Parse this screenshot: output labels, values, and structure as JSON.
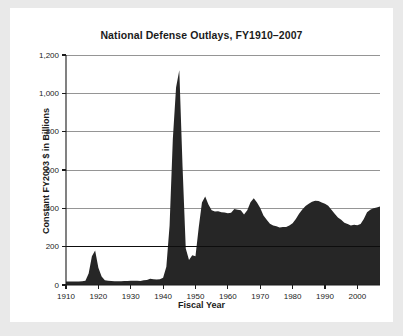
{
  "figure": {
    "background": "#e9e9e9",
    "card_background": "#ffffff",
    "title": "National Defense Outlays, FY1910–2007"
  },
  "chart_data": {
    "type": "area",
    "title": "National Defense Outlays, FY1910–2007",
    "xlabel": "Fiscal Year",
    "ylabel": "Constant FY2003 $ in Billions",
    "xlim": [
      1910,
      2007
    ],
    "ylim": [
      0,
      1200
    ],
    "grid": true,
    "legend": null,
    "fill_color": "#262626",
    "gridline_color": "#8a8a8a",
    "axis_color": "#1b1b1b",
    "emphasized_gridline": 200,
    "ytick_labels": [
      "0",
      "200",
      "400",
      "600",
      "800",
      "1,000",
      "1,200"
    ],
    "yticks": [
      0,
      200,
      400,
      600,
      800,
      1000,
      1200
    ],
    "xtick_labels": [
      "1910",
      "1920",
      "1930",
      "1940",
      "1950",
      "1960",
      "1970",
      "1980",
      "1990",
      "2000"
    ],
    "xticks": [
      1910,
      1920,
      1930,
      1940,
      1950,
      1960,
      1970,
      1980,
      1990,
      2000
    ],
    "x": [
      1910,
      1911,
      1912,
      1913,
      1914,
      1915,
      1916,
      1917,
      1918,
      1919,
      1920,
      1921,
      1922,
      1923,
      1924,
      1925,
      1926,
      1927,
      1928,
      1929,
      1930,
      1931,
      1932,
      1933,
      1934,
      1935,
      1936,
      1937,
      1938,
      1939,
      1940,
      1941,
      1942,
      1943,
      1944,
      1945,
      1946,
      1947,
      1948,
      1949,
      1950,
      1951,
      1952,
      1953,
      1954,
      1955,
      1956,
      1957,
      1958,
      1959,
      1960,
      1961,
      1962,
      1963,
      1964,
      1965,
      1966,
      1967,
      1968,
      1969,
      1970,
      1971,
      1972,
      1973,
      1974,
      1975,
      1976,
      1977,
      1978,
      1979,
      1980,
      1981,
      1982,
      1983,
      1984,
      1985,
      1986,
      1987,
      1988,
      1989,
      1990,
      1991,
      1992,
      1993,
      1994,
      1995,
      1996,
      1997,
      1998,
      1999,
      2000,
      2001,
      2002,
      2003,
      2004,
      2005,
      2006,
      2007
    ],
    "values": [
      18,
      18,
      18,
      18,
      18,
      19,
      22,
      60,
      150,
      180,
      90,
      45,
      25,
      22,
      21,
      20,
      20,
      20,
      21,
      21,
      22,
      22,
      22,
      21,
      25,
      26,
      32,
      30,
      29,
      30,
      38,
      95,
      310,
      760,
      1030,
      1120,
      620,
      190,
      130,
      155,
      150,
      300,
      430,
      462,
      420,
      390,
      383,
      385,
      380,
      378,
      374,
      377,
      396,
      392,
      390,
      368,
      390,
      432,
      452,
      430,
      402,
      362,
      340,
      320,
      310,
      306,
      300,
      302,
      303,
      310,
      322,
      345,
      372,
      394,
      412,
      424,
      434,
      440,
      438,
      430,
      424,
      414,
      392,
      372,
      352,
      340,
      325,
      318,
      310,
      314,
      312,
      318,
      345,
      380,
      392,
      400,
      404,
      410
    ]
  },
  "axis_titles": {
    "y": "Constant FY2003 $ in Billions",
    "x": "Fiscal Year"
  }
}
